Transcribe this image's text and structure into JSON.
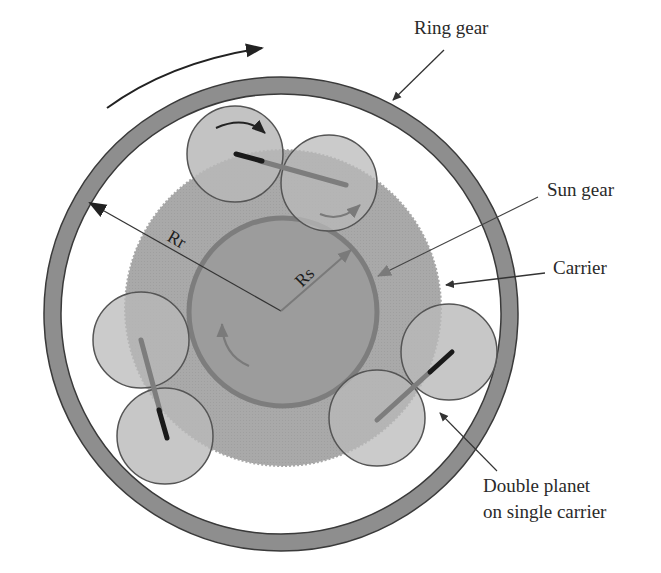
{
  "diagram": {
    "type": "planetary-gear-schematic",
    "colors": {
      "background": "#ffffff",
      "ring_fill": "#8e8e8e",
      "ring_stroke": "#3a3a3a",
      "carrier_fill": "#a9a9a9",
      "sun_fill": "#9a9a9a",
      "sun_stroke": "#7a7a7a",
      "planet_fill": "#b8b8b8",
      "planet_stroke": "#555555",
      "shaft_light": "#7d7d7d",
      "shaft_dark": "#1a1a1a",
      "leader": "#333333",
      "rotation_arrow": "#222222",
      "inner_arrow": "#7a7a7a"
    },
    "labels": {
      "ring_gear": "Ring gear",
      "sun_gear": "Sun gear",
      "carrier": "Carrier",
      "double_planet_line1": "Double planet",
      "double_planet_line2": "on single carrier",
      "ring_radius": "Rr",
      "sun_radius": "Rs"
    },
    "components": {
      "ring_gear": {
        "cx": 281,
        "cy": 314,
        "outer_r": 237,
        "inner_r": 220
      },
      "carrier": {
        "cx": 283,
        "cy": 308,
        "r": 158
      },
      "sun_gear": {
        "cx": 283,
        "cy": 312,
        "r": 94
      },
      "planet_pairs": [
        {
          "name": "top",
          "planets": [
            {
              "cx": 235,
              "cy": 154,
              "r": 48
            },
            {
              "cx": 329,
              "cy": 183,
              "r": 48
            }
          ]
        },
        {
          "name": "left",
          "planets": [
            {
              "cx": 141,
              "cy": 340,
              "r": 48
            },
            {
              "cx": 165,
              "cy": 436,
              "r": 48
            }
          ]
        },
        {
          "name": "right",
          "planets": [
            {
              "cx": 449,
              "cy": 352,
              "r": 48
            },
            {
              "cx": 377,
              "cy": 418,
              "r": 48
            }
          ]
        }
      ]
    }
  }
}
